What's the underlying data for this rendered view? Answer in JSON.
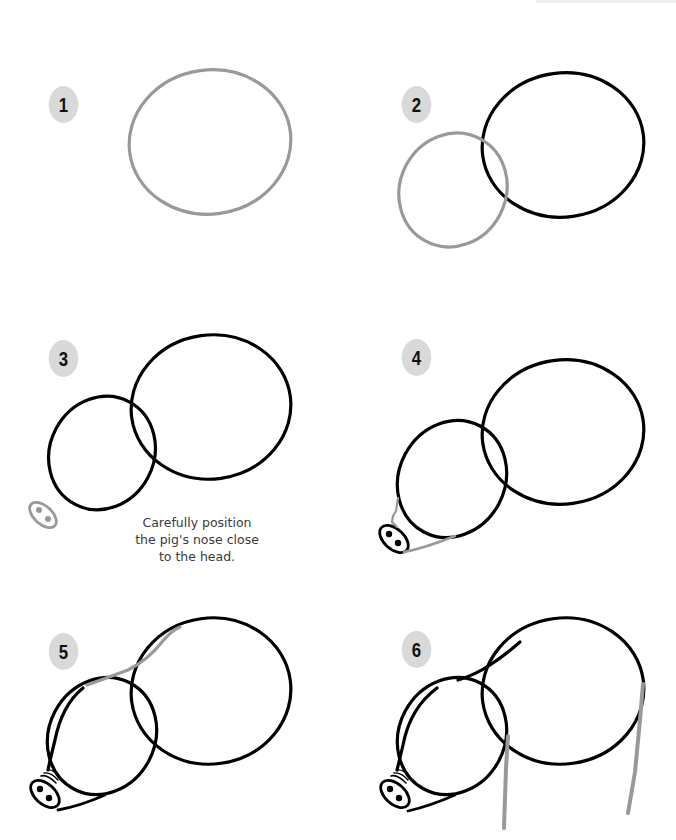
{
  "colors": {
    "new_stroke": "#999999",
    "existing_stroke": "#000000",
    "badge_bg": "#d9d9d9",
    "badge_text": "#111111",
    "caption_text": "#3a3a3a"
  },
  "steps": [
    {
      "number": "1",
      "description": "Draw a large oval for the body"
    },
    {
      "number": "2",
      "description": "Add a smaller overlapping oval for the head"
    },
    {
      "number": "3",
      "description": "Add the snout with two nostrils",
      "caption": "Carefully position the pig's nose close to the head."
    },
    {
      "number": "4",
      "description": "Connect the snout to the head"
    },
    {
      "number": "5",
      "description": "Add wrinkles on snout and connect head to body along the neck"
    },
    {
      "number": "6",
      "description": "Draw front and back legs"
    }
  ],
  "caption_lines": [
    "Carefully position",
    "the pig's nose close",
    "to the head."
  ]
}
